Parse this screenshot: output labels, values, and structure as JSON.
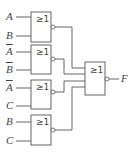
{
  "diagram": {
    "type": "logic-circuit",
    "gate_symbol": "≥1",
    "gates": [
      {
        "id": "G1",
        "type": "NOR",
        "inputs": [
          "A",
          "B"
        ]
      },
      {
        "id": "G2",
        "type": "NOR",
        "inputs": [
          "A̅",
          "B̅"
        ]
      },
      {
        "id": "G3",
        "type": "NOR",
        "inputs": [
          "A̅",
          "C"
        ]
      },
      {
        "id": "G4",
        "type": "NOR",
        "inputs": [
          "B",
          "C"
        ]
      },
      {
        "id": "G5",
        "type": "NOR",
        "inputs": [
          "G1",
          "G2",
          "G3",
          "G4"
        ],
        "output": "F"
      }
    ],
    "labels": {
      "g1_in1": "A",
      "g1_in2": "B",
      "g2_in1": "A",
      "g2_in2": "B",
      "g3_in1": "A",
      "g3_in2": "C",
      "g4_in1": "B",
      "g4_in2": "C",
      "output": "F"
    },
    "overlined": [
      "g2_in1",
      "g2_in2",
      "g3_in1"
    ]
  }
}
